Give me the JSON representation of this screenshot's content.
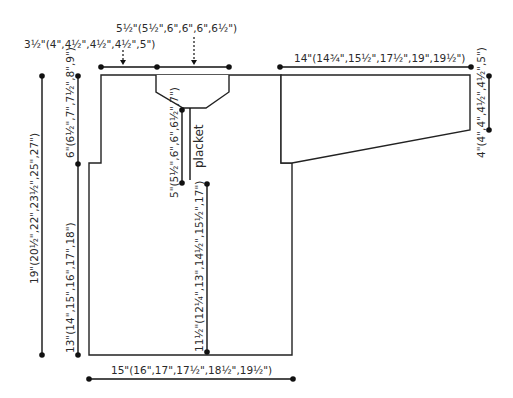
{
  "diagram": {
    "labels": {
      "shoulder": "3½\"(4\",4½\",4½\",4½\",5\")",
      "neck_width": "5½\"(5½\",6\",6\",6\",6½\")",
      "sleeve_length": "14\"(14¾\",15½\",17½\",19\",19½\")",
      "cuff_depth": "4\"(4\",4\",4½\",4½\",5\")",
      "total_length": "19\"(20½\",22\",23½\",25\",27\")",
      "armhole_depth": "6\"(6½\",7\",7½\",8\",9\")",
      "body_to_armhole": "13\"(14\",15\",16\",17\",18\")",
      "placket_length": "5\"(5½\",6\",6\",6½\",7\")",
      "placket": "placket",
      "hem_to_placket": "11½\"(12¼\",13\",14½\",15½\",17\")",
      "width": "15\"(16\",17\",17½\",18½\",19½\")"
    }
  }
}
